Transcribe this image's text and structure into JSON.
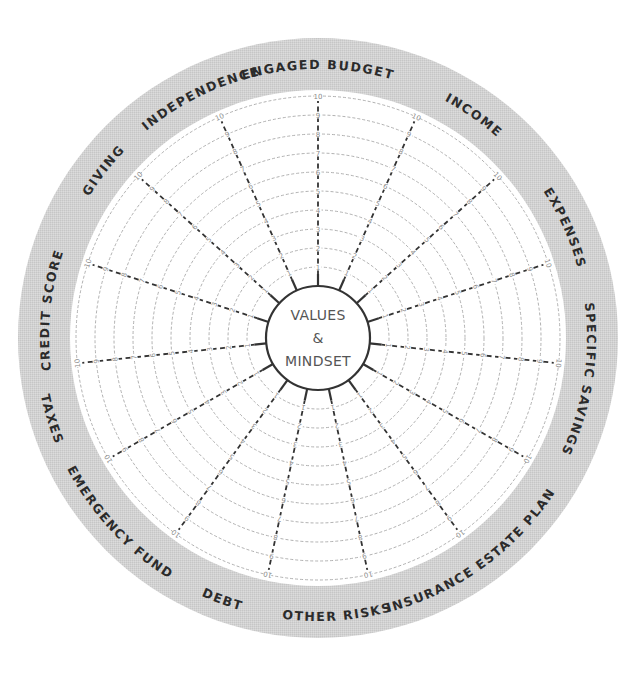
{
  "diagram": {
    "type": "financial-wellness-wheel",
    "center": {
      "line1": "VALUES",
      "line2": "&",
      "line3": "MINDSET"
    },
    "scale": {
      "min": 1,
      "max": 10,
      "ticks": [
        1,
        2,
        3,
        4,
        5,
        6,
        7,
        8,
        9,
        10
      ]
    },
    "segments": [
      {
        "label": "ENGAGED BUDGET"
      },
      {
        "label": "INCOME"
      },
      {
        "label": "EXPENSES"
      },
      {
        "label": "SPECIFIC SAVINGS"
      },
      {
        "label": "ESTATE PLAN"
      },
      {
        "label": "INSURANCE"
      },
      {
        "label": "OTHER RISKS"
      },
      {
        "label": "DEBT"
      },
      {
        "label": "EMERGENCY FUND"
      },
      {
        "label": "TAXES"
      },
      {
        "label": "CREDIT SCORE"
      },
      {
        "label": "GIVING"
      },
      {
        "label": "INDEPENDENCE"
      }
    ],
    "colors": {
      "outer_ring": "#d4d4d4",
      "inner_field": "#ffffff",
      "spoke": "#333333",
      "ring_lines": "#a8a8a8",
      "label": "#2b2b2b",
      "center_text": "#555555"
    }
  }
}
